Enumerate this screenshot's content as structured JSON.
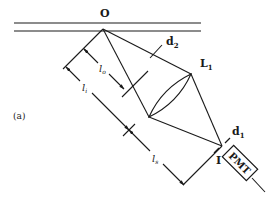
{
  "figure": {
    "panel_label": "(a)",
    "labels": {
      "object": "O",
      "image": "I",
      "lens": "L",
      "lens_sub": "1",
      "aperture_d2": "d",
      "aperture_d2_sub": "2",
      "aperture_d1": "d",
      "aperture_d1_sub": "1",
      "detector": "PMT",
      "dim_lo": "l",
      "dim_lo_sub": "o",
      "dim_li": "l",
      "dim_li_sub": "i",
      "dim_ls": "l",
      "dim_ls_sub": "s"
    },
    "colors": {
      "ink": "#1a1a1a",
      "background": "#ffffff"
    }
  }
}
